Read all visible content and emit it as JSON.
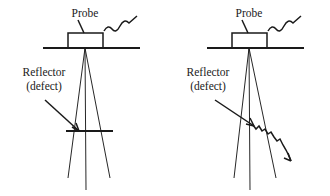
{
  "figure": {
    "background_color": "#ffffff",
    "ink_color": "#1a1a1a",
    "width": 330,
    "height": 196,
    "panels": [
      {
        "id": "left-panel",
        "name": "smooth-flat-reflector-panel",
        "probe_label": "Probe",
        "reflector_label_line1": "Reflector",
        "reflector_label_line2": "(defect)",
        "reflector_kind": "flat",
        "reflector_description": "smooth horizontal flat reflector",
        "probe_box": {
          "x": 68,
          "y": 33,
          "width": 35,
          "height": 15
        },
        "surface_line": {
          "x1": 43,
          "y1": 48,
          "x2": 140,
          "y2": 48
        },
        "beam_apex": {
          "x": 85,
          "y": 48
        },
        "beam_left_end": {
          "x": 68,
          "y": 178
        },
        "beam_right_end": {
          "x": 110,
          "y": 178
        },
        "axis_end": {
          "x": 86,
          "y": 190
        },
        "flat_reflector": {
          "x1": 66,
          "y1": 131,
          "x2": 113,
          "y2": 131
        },
        "leader_start": {
          "x": 45,
          "y": 100
        },
        "leader_end": {
          "x": 79,
          "y": 131
        },
        "probe_leader_start": {
          "x": 78,
          "y": 20
        },
        "probe_leader_end": {
          "x": 84,
          "y": 33
        },
        "probe_label_pos": {
          "x": 85,
          "y": 17
        },
        "reflector_label_pos": {
          "x": 44,
          "y": 76
        },
        "defect_label_pos": {
          "x": 44,
          "y": 90
        }
      },
      {
        "id": "right-panel",
        "name": "rough-inclined-reflector-panel",
        "probe_label": "Probe",
        "reflector_label_line1": "Reflector",
        "reflector_label_line2": "(defect)",
        "reflector_kind": "rough-inclined",
        "reflector_description": "rough jagged inclined reflector sloping down to the right",
        "probe_box": {
          "x": 232,
          "y": 33,
          "width": 35,
          "height": 15
        },
        "surface_line": {
          "x1": 207,
          "y1": 48,
          "x2": 304,
          "y2": 48
        },
        "beam_apex": {
          "x": 249,
          "y": 48
        },
        "beam_left_end": {
          "x": 234,
          "y": 178
        },
        "beam_right_end": {
          "x": 276,
          "y": 178
        },
        "axis_end": {
          "x": 250,
          "y": 190
        },
        "rough_reflector_start": {
          "x": 253,
          "y": 125
        },
        "rough_reflector_end": {
          "x": 291,
          "y": 161
        },
        "leader_start": {
          "x": 215,
          "y": 100
        },
        "leader_end": {
          "x": 254,
          "y": 126
        },
        "probe_leader_start": {
          "x": 242,
          "y": 20
        },
        "probe_leader_end": {
          "x": 248,
          "y": 33
        },
        "probe_label_pos": {
          "x": 249,
          "y": 17
        },
        "reflector_label_pos": {
          "x": 208,
          "y": 76
        },
        "defect_label_pos": {
          "x": 208,
          "y": 90
        }
      }
    ]
  }
}
